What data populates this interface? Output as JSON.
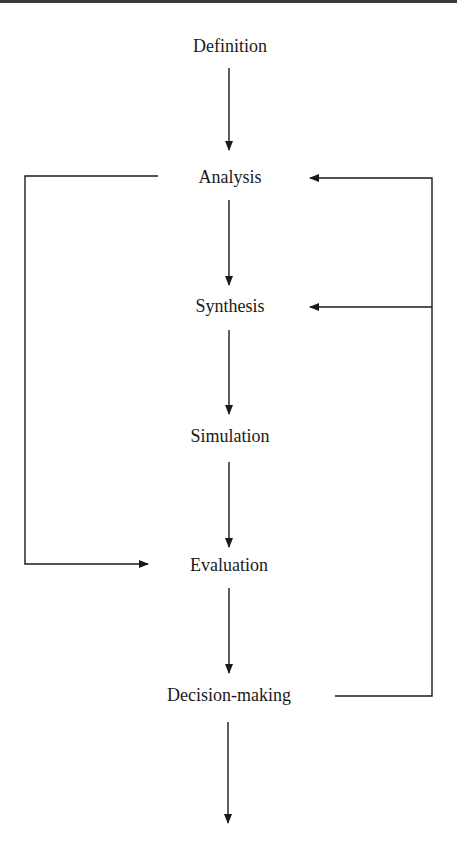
{
  "diagram": {
    "type": "flowchart",
    "nodes": [
      {
        "id": "definition",
        "label": "Definition"
      },
      {
        "id": "analysis",
        "label": "Analysis"
      },
      {
        "id": "synthesis",
        "label": "Synthesis"
      },
      {
        "id": "simulation",
        "label": "Simulation"
      },
      {
        "id": "evaluation",
        "label": "Evaluation"
      },
      {
        "id": "decision",
        "label": "Decision-making"
      }
    ],
    "edges": [
      {
        "from": "definition",
        "to": "analysis"
      },
      {
        "from": "analysis",
        "to": "synthesis"
      },
      {
        "from": "synthesis",
        "to": "simulation"
      },
      {
        "from": "simulation",
        "to": "evaluation"
      },
      {
        "from": "evaluation",
        "to": "decision"
      },
      {
        "from": "decision",
        "to": "output"
      },
      {
        "from": "analysis",
        "to": "evaluation",
        "route": "left feedback"
      },
      {
        "from": "decision",
        "to": "analysis",
        "route": "right feedback"
      },
      {
        "from": "decision",
        "to": "synthesis",
        "route": "right feedback"
      }
    ],
    "colors": {
      "line": "#1a1a1a",
      "background": "#ffffff"
    }
  }
}
